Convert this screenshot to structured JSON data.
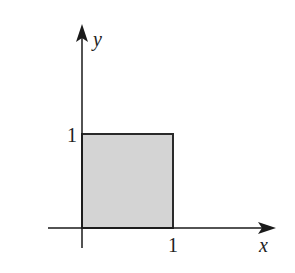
{
  "diagram": {
    "type": "unit-square-region",
    "axes": {
      "x_label": "x",
      "y_label": "y"
    },
    "ticks": {
      "x_tick_label": "1",
      "y_tick_label": "1"
    },
    "region": {
      "x_range": [
        0,
        1
      ],
      "y_range": [
        0,
        1
      ],
      "fill_color": "#d4d4d4",
      "stroke_color": "#2a2a2a"
    },
    "axis_color": "#1a1a1a"
  }
}
